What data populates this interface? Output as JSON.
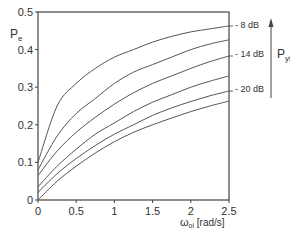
{
  "chart_data": {
    "type": "line",
    "title": "",
    "xlabel": "ω_oi [rad/s]",
    "ylabel": "P_e",
    "xlim": [
      0,
      2.5
    ],
    "ylim": [
      0,
      0.5
    ],
    "x_ticks": [
      "0",
      "0.5",
      "1",
      "1.5",
      "2",
      "2.5"
    ],
    "y_ticks": [
      "0",
      "0.1",
      "0.2",
      "0.3",
      "0.4",
      "0.5"
    ],
    "grid": false,
    "x": [
      0,
      0.25,
      0.5,
      0.75,
      1.0,
      1.25,
      1.5,
      1.75,
      2.0,
      2.25,
      2.5
    ],
    "series": [
      {
        "name": "curve 1 (-8 dB)",
        "values": [
          0.1,
          0.25,
          0.31,
          0.35,
          0.38,
          0.4,
          0.42,
          0.435,
          0.447,
          0.455,
          0.463
        ]
      },
      {
        "name": "curve 2",
        "values": [
          0.08,
          0.17,
          0.23,
          0.27,
          0.31,
          0.34,
          0.36,
          0.38,
          0.4,
          0.415,
          0.426
        ]
      },
      {
        "name": "curve 3 (-14 dB)",
        "values": [
          0.065,
          0.13,
          0.18,
          0.22,
          0.255,
          0.285,
          0.31,
          0.33,
          0.35,
          0.368,
          0.383
        ]
      },
      {
        "name": "curve 4",
        "values": [
          0.035,
          0.09,
          0.135,
          0.175,
          0.205,
          0.235,
          0.26,
          0.28,
          0.3,
          0.316,
          0.33
        ]
      },
      {
        "name": "curve 5 (-20 dB)",
        "values": [
          0.02,
          0.07,
          0.11,
          0.145,
          0.175,
          0.2,
          0.225,
          0.245,
          0.262,
          0.277,
          0.29
        ]
      },
      {
        "name": "curve 6",
        "values": [
          0.0,
          0.05,
          0.09,
          0.125,
          0.155,
          0.18,
          0.2,
          0.218,
          0.235,
          0.25,
          0.263
        ]
      }
    ],
    "annotations": [
      {
        "text": "- 8 dB",
        "at_curve": 1
      },
      {
        "text": "- 14 dB",
        "at_curve": 3
      },
      {
        "text": "- 20 dB",
        "at_curve": 5
      },
      {
        "text": "P_yi",
        "note": "arrow pointing up (increasing P_yi)"
      }
    ]
  },
  "labels": {
    "ylabel_main": "P",
    "ylabel_sub": "e",
    "xlabel_main": "ω",
    "xlabel_sub": "oi",
    "xlabel_unit": " [rad/s]",
    "pyi_main": "P",
    "pyi_sub": "yi",
    "db8": "- 8 dB",
    "db14": "- 14 dB",
    "db20": "- 20 dB"
  }
}
